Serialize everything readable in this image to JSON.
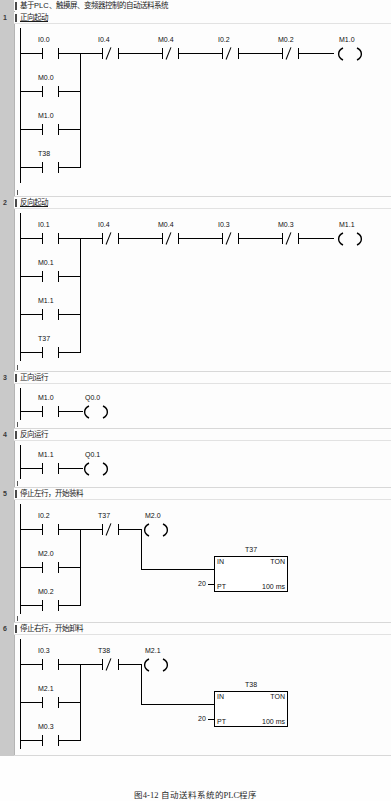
{
  "document": {
    "program_title": "基于PLC、触摸屏、变频器控制的自动送料系统",
    "caption": "图4-12  自动送料系统的PLC程序"
  },
  "symbols": {
    "no_contact": "normally-open-contact",
    "nc_contact": "normally-closed-contact",
    "coil": "output-coil",
    "ton": "on-delay-timer-box"
  },
  "networks": [
    {
      "number": "1",
      "comment": "正向起动",
      "branches": [
        "I0.0",
        "M0.0",
        "M1.0",
        "T38"
      ],
      "series": [
        {
          "tag": "I0.4",
          "type": "nc"
        },
        {
          "tag": "M0.4",
          "type": "nc"
        },
        {
          "tag": "I0.2",
          "type": "nc"
        },
        {
          "tag": "M0.2",
          "type": "nc"
        }
      ],
      "coil": "M1.0"
    },
    {
      "number": "2",
      "comment": "反向起动",
      "branches": [
        "I0.1",
        "M0.1",
        "M1.1",
        "T37"
      ],
      "series": [
        {
          "tag": "I0.4",
          "type": "nc"
        },
        {
          "tag": "M0.4",
          "type": "nc"
        },
        {
          "tag": "I0.3",
          "type": "nc"
        },
        {
          "tag": "M0.3",
          "type": "nc"
        }
      ],
      "coil": "M1.1"
    },
    {
      "number": "3",
      "comment": "正向运行",
      "branches": [
        "M1.0"
      ],
      "series": [],
      "coil": "Q0.0"
    },
    {
      "number": "4",
      "comment": "反向运行",
      "branches": [
        "M1.1"
      ],
      "series": [],
      "coil": "Q0.1"
    },
    {
      "number": "5",
      "comment": "停止左行，开始装料",
      "branches": [
        "I0.2",
        "M2.0",
        "M0.2"
      ],
      "series": [
        {
          "tag": "T37",
          "type": "nc"
        }
      ],
      "coil": "M2.0",
      "timer": {
        "name": "T37",
        "in_label": "IN",
        "type_label": "TON",
        "pt_label": "PT",
        "pt_value": "20",
        "time_base": "100 ms"
      }
    },
    {
      "number": "6",
      "comment": "停止右行，开始卸料",
      "branches": [
        "I0.3",
        "M2.1",
        "M0.3"
      ],
      "series": [
        {
          "tag": "T38",
          "type": "nc"
        }
      ],
      "coil": "M2.1",
      "timer": {
        "name": "T38",
        "in_label": "IN",
        "type_label": "TON",
        "pt_label": "PT",
        "pt_value": "20",
        "time_base": "100 ms"
      }
    }
  ],
  "colors": {
    "gutter": "#c9c9c9",
    "line": "#000000",
    "text": "#111111",
    "background": "#fdfdfd"
  }
}
